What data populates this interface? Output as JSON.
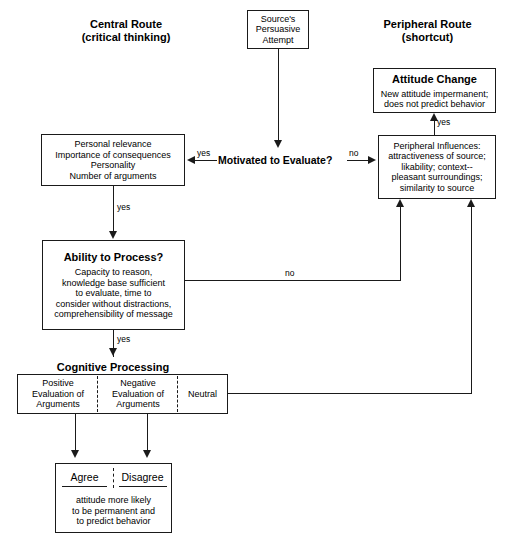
{
  "diagram": {
    "headers": {
      "central_route": "Central Route\n(critical thinking)",
      "peripheral_route": "Peripheral Route\n(shortcut)"
    },
    "nodes": {
      "source": {
        "label": "Source's\nPersuasive\nAttempt"
      },
      "attitude_change": {
        "title": "Attitude Change",
        "body": "New attitude impermanent;\ndoes not predict behavior"
      },
      "personal_factors": {
        "body": "Personal relevance\nImportance of consequences\nPersonality\nNumber of arguments"
      },
      "motivated": {
        "label": "Motivated to Evaluate?"
      },
      "peripheral_influences": {
        "body": "Peripheral Influences:\nattractiveness of source;\nlikability; context--\npleasant surroundings;\nsimilarity to source"
      },
      "ability": {
        "title": "Ability to Process?",
        "body": "Capacity to reason,\nknowledge base sufficient\nto evaluate, time to\nconsider without distractions,\ncomprehensibility of message"
      },
      "cognitive_processing": {
        "heading": "Cognitive Processing",
        "cells": [
          "Positive\nEvaluation of\nArguments",
          "Negative\nEvaluation of\nArguments",
          "Neutral"
        ]
      },
      "outcome": {
        "cells": [
          "Agree",
          "Disagree"
        ],
        "body": "attitude more likely\nto be permanent and\nto predict behavior"
      }
    },
    "edge_labels": {
      "motivated_yes": "yes",
      "motivated_no": "no",
      "personal_yes": "yes",
      "ability_no": "no",
      "ability_yes": "yes",
      "peripheral_yes": "yes"
    },
    "colors": {
      "stroke": "#1a1a1a",
      "background": "#ffffff",
      "text": "#000000"
    }
  }
}
